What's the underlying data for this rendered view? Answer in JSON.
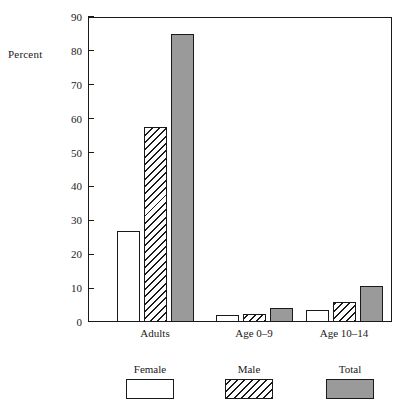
{
  "chart_data": {
    "type": "bar",
    "title": "",
    "subtitle": "",
    "xlabel": "",
    "ylabel": "Percent",
    "categories": [
      "Adults",
      "Age 0–9",
      "Age 10–14"
    ],
    "series": [
      {
        "name": "Female",
        "values": [
          27,
          2,
          3.5
        ],
        "fill": "white",
        "color": "#ffffff"
      },
      {
        "name": "Male",
        "values": [
          57.5,
          2.5,
          6
        ],
        "fill": "diagonal-hatch",
        "color": "#ffffff"
      },
      {
        "name": "Total",
        "values": [
          85,
          4,
          10.5
        ],
        "fill": "solid-gray",
        "color": "#9a9a9a"
      }
    ],
    "ylim": [
      0,
      90
    ],
    "yticks": [
      0,
      10,
      20,
      30,
      40,
      50,
      60,
      70,
      80,
      90
    ],
    "ytick_labels": [
      "0",
      "10",
      "20",
      "30",
      "40",
      "50",
      "60",
      "70",
      "80",
      "90"
    ],
    "grid": false,
    "legend_position": "bottom",
    "frame": "full-box"
  },
  "axis": {
    "y_title": "Percent"
  },
  "legend": {
    "items": [
      {
        "label": "Female"
      },
      {
        "label": "Male"
      },
      {
        "label": "Total"
      }
    ]
  },
  "colors": {
    "axis": "#1a1a1a",
    "total_fill": "#9a9a9a",
    "background": "#ffffff"
  }
}
